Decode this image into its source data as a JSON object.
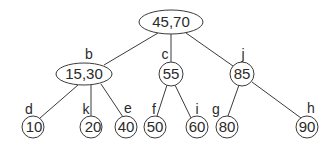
{
  "diagram": {
    "type": "2-3 search tree",
    "colors": {
      "stroke": "#3a3a3a",
      "text": "#2a2a2a",
      "background": "#ffffff"
    },
    "nodes": [
      {
        "id": "root",
        "label": "",
        "value": "45,70",
        "shape": "ellipse",
        "cx": 171,
        "cy": 22,
        "rx": 32,
        "ry": 12
      },
      {
        "id": "b",
        "label": "b",
        "value": "15,30",
        "shape": "ellipse",
        "cx": 84,
        "cy": 74,
        "rx": 28,
        "ry": 11
      },
      {
        "id": "c",
        "label": "c",
        "value": "55",
        "shape": "circle",
        "cx": 171,
        "cy": 74,
        "r": 12
      },
      {
        "id": "j",
        "label": "j",
        "value": "85",
        "shape": "circle",
        "cx": 242,
        "cy": 74,
        "r": 12
      },
      {
        "id": "d",
        "label": "d",
        "value": "10",
        "shape": "circle",
        "cx": 33,
        "cy": 127,
        "r": 11
      },
      {
        "id": "k",
        "label": "k",
        "value": "20",
        "shape": "circle",
        "cx": 91,
        "cy": 127,
        "r": 11
      },
      {
        "id": "e",
        "label": "e",
        "value": "40",
        "shape": "circle",
        "cx": 126,
        "cy": 127,
        "r": 11
      },
      {
        "id": "f",
        "label": "f",
        "value": "50",
        "shape": "circle",
        "cx": 155,
        "cy": 127,
        "r": 11
      },
      {
        "id": "i",
        "label": "i",
        "value": "60",
        "shape": "circle",
        "cx": 197,
        "cy": 127,
        "r": 11
      },
      {
        "id": "g",
        "label": "g",
        "value": "80",
        "shape": "circle",
        "cx": 227,
        "cy": 127,
        "r": 11
      },
      {
        "id": "h",
        "label": "h",
        "value": "90",
        "shape": "circle",
        "cx": 307,
        "cy": 127,
        "r": 11
      }
    ],
    "edges": [
      [
        "root",
        "b"
      ],
      [
        "root",
        "c"
      ],
      [
        "root",
        "j"
      ],
      [
        "b",
        "d"
      ],
      [
        "b",
        "k"
      ],
      [
        "b",
        "e"
      ],
      [
        "c",
        "f"
      ],
      [
        "c",
        "i"
      ],
      [
        "j",
        "g"
      ],
      [
        "j",
        "h"
      ]
    ]
  }
}
